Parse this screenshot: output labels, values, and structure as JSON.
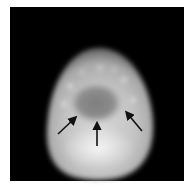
{
  "figure": {
    "background_color": "#ffffff",
    "frame_color": "#000000",
    "annotations": [
      {
        "type": "arrow",
        "direction": "up-right",
        "color": "#111111"
      },
      {
        "type": "arrow",
        "direction": "up",
        "color": "#111111"
      },
      {
        "type": "arrow",
        "direction": "up-left",
        "color": "#111111"
      }
    ]
  }
}
